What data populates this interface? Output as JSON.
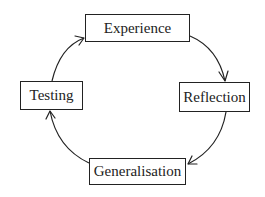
{
  "diagram": {
    "type": "cycle",
    "title": "",
    "colors": {
      "stroke": "#222222",
      "background": "#ffffff",
      "text": "#222222"
    },
    "nodes": [
      {
        "id": "experience",
        "label": "Experience"
      },
      {
        "id": "reflection",
        "label": "Reflection"
      },
      {
        "id": "generalisation",
        "label": "Generalisation"
      },
      {
        "id": "testing",
        "label": "Testing"
      }
    ],
    "edges": [
      {
        "from": "experience",
        "to": "reflection"
      },
      {
        "from": "reflection",
        "to": "generalisation"
      },
      {
        "from": "generalisation",
        "to": "testing"
      },
      {
        "from": "testing",
        "to": "experience"
      }
    ]
  }
}
